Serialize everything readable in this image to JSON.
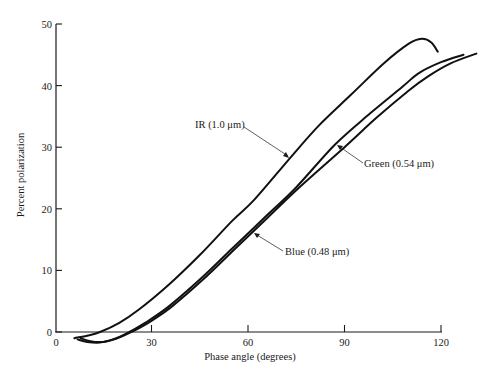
{
  "chart_data": {
    "type": "line",
    "title": "",
    "xlabel": "Phase angle (degrees)",
    "ylabel": "Percent polarization",
    "xlim": [
      0,
      120
    ],
    "ylim": [
      0,
      50
    ],
    "xticks": [
      0,
      30,
      60,
      90,
      120
    ],
    "yticks": [
      0,
      10,
      20,
      30,
      40,
      50
    ],
    "grid": false,
    "legend": "inline annotations with leader arrows",
    "series": [
      {
        "name": "IR (1.0 μm)",
        "x": [
          6,
          10,
          14,
          20,
          26,
          35,
          45,
          55,
          62,
          73,
          82,
          92,
          102,
          110,
          114,
          117,
          119
        ],
        "y": [
          -1.0,
          -0.6,
          0.0,
          1.5,
          3.6,
          7.5,
          12.5,
          18.0,
          21.5,
          28.2,
          33.5,
          38.5,
          43.5,
          46.8,
          47.6,
          47.0,
          45.5
        ]
      },
      {
        "name": "Green (0.54 μm)",
        "x": [
          7,
          10,
          14,
          18,
          22,
          28,
          35,
          45,
          55,
          65,
          75,
          87,
          98,
          108,
          113,
          120,
          127
        ],
        "y": [
          -1.2,
          -1.6,
          -1.7,
          -1.2,
          -0.3,
          1.5,
          4.0,
          8.5,
          13.5,
          18.5,
          23.5,
          30.4,
          35.5,
          39.8,
          42.0,
          43.8,
          45.0
        ]
      },
      {
        "name": "Blue (0.48 μm)",
        "x": [
          8,
          11,
          15,
          19,
          23,
          29,
          36,
          46,
          56,
          66,
          76,
          90,
          100,
          110,
          116,
          123,
          131
        ],
        "y": [
          -1.0,
          -1.5,
          -1.6,
          -1.1,
          -0.2,
          1.5,
          4.0,
          8.5,
          13.5,
          18.5,
          23.5,
          30.0,
          34.8,
          39.2,
          41.5,
          43.6,
          45.2
        ]
      }
    ],
    "annotations": [
      {
        "text": "IR (1.0 μm)",
        "points_to": [
          73,
          28.2
        ]
      },
      {
        "text": "Green (0.54 μm)",
        "points_to": [
          90,
          30.5
        ]
      },
      {
        "text": "Blue (0.48 μm)",
        "points_to": [
          62,
          16.5
        ]
      }
    ]
  }
}
